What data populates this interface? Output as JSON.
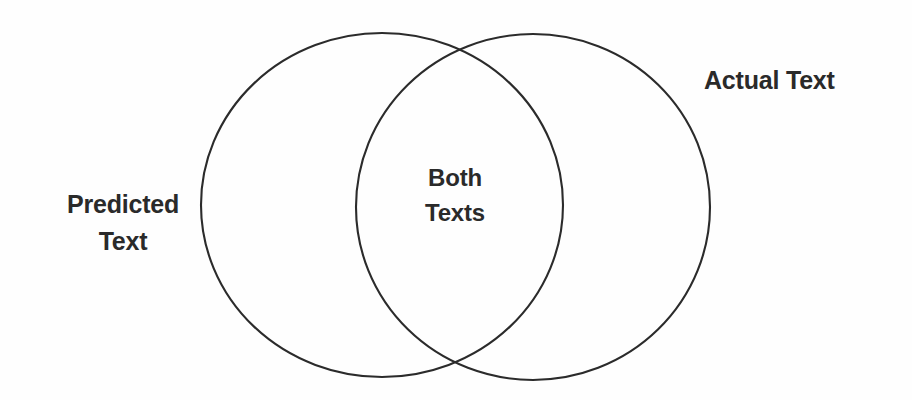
{
  "diagram": {
    "type": "venn",
    "kind": "two-set-venn-diagram",
    "background_color": "#fefefe",
    "stroke_color": "#2b2b2b",
    "text_color": "#2a2a2a",
    "sets": [
      {
        "id": "predicted",
        "label": "Predicted\nText",
        "label_position": "outside-left",
        "shape": "ellipse",
        "center_x": 382,
        "center_y": 205,
        "radius_x": 181,
        "radius_y": 172
      },
      {
        "id": "actual",
        "label": "Actual Text",
        "label_position": "outside-upper-right",
        "shape": "ellipse",
        "center_x": 533,
        "center_y": 207,
        "radius_x": 177,
        "radius_y": 173
      }
    ],
    "intersection": {
      "id": "both",
      "label": "Both\nTexts",
      "label_position": "inside-center",
      "center_x": 455,
      "center_y": 196
    }
  }
}
